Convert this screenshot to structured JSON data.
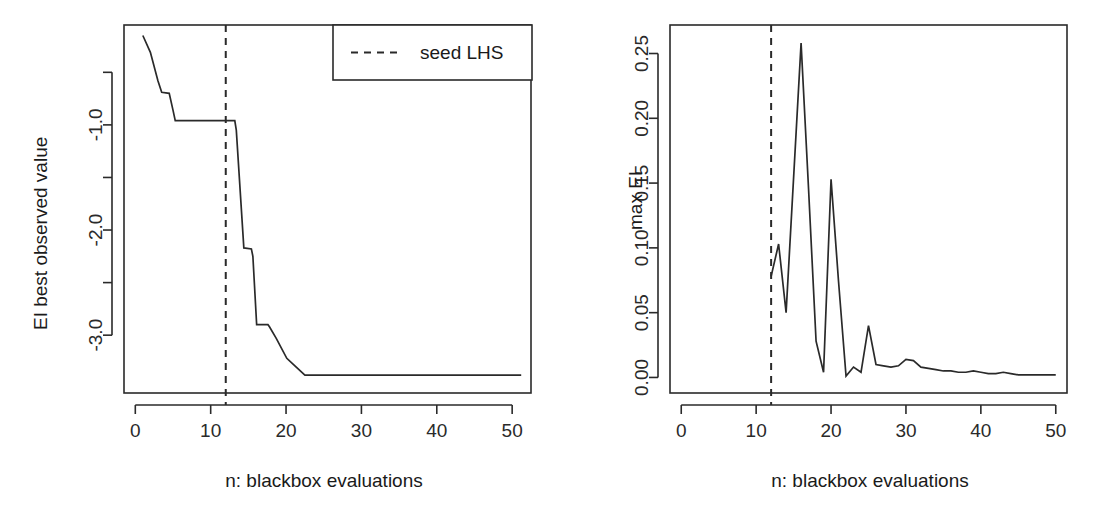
{
  "figure": {
    "background": "#ffffff",
    "ink_color": "#2a2a2a",
    "panel_count": 2
  },
  "chart_data": [
    {
      "type": "line",
      "panel": "left",
      "title": "",
      "xlabel": "n: blackbox evaluations",
      "ylabel": "EI best observed value",
      "xlim": [
        -1.5,
        52.5
      ],
      "ylim": [
        -3.55,
        -0.05
      ],
      "xticks": [
        0,
        10,
        20,
        30,
        40,
        50
      ],
      "xtick_labels": [
        "0",
        "10",
        "20",
        "30",
        "40",
        "50"
      ],
      "yticks": [
        -0.5,
        -1.0,
        -1.5,
        -2.0,
        -2.5,
        -3.0
      ],
      "ytick_labels": [
        "",
        "-1.0",
        "",
        "-2.0",
        "",
        "-3.0"
      ],
      "grid": false,
      "legend": {
        "position": "top-right",
        "entries": [
          {
            "label": "seed LHS",
            "style": "dashed",
            "color": "#2a2a2a"
          }
        ]
      },
      "annotations": [
        {
          "type": "vline",
          "label": "seed LHS",
          "x": 12,
          "style": "dashed"
        }
      ],
      "series": [
        {
          "name": "EI best observed value",
          "style": "solid",
          "color": "#2a2a2a",
          "x": [
            1,
            2,
            3,
            3.5,
            4.5,
            5,
            5.3,
            13.2,
            13.4,
            14.4,
            15.4,
            15.6,
            16.1,
            17.6,
            17.8,
            18.7,
            20.1,
            21.0,
            22.5,
            51.2
          ],
          "y": [
            -0.15,
            -0.31,
            -0.58,
            -0.69,
            -0.7,
            -0.86,
            -0.96,
            -0.96,
            -1.05,
            -2.17,
            -2.18,
            -2.25,
            -2.9,
            -2.9,
            -2.92,
            -3.03,
            -3.22,
            -3.28,
            -3.38,
            -3.38
          ]
        }
      ]
    },
    {
      "type": "line",
      "panel": "right",
      "title": "",
      "xlabel": "n: blackbox evaluations",
      "ylabel": "max EI",
      "xlim": [
        -1.5,
        51.5
      ],
      "ylim": [
        -0.012,
        0.272
      ],
      "xticks": [
        0,
        10,
        20,
        30,
        40,
        50
      ],
      "xtick_labels": [
        "0",
        "10",
        "20",
        "30",
        "40",
        "50"
      ],
      "yticks": [
        0.0,
        0.05,
        0.1,
        0.15,
        0.2,
        0.25
      ],
      "ytick_labels": [
        "0.00",
        "0.05",
        "0.10",
        "0.15",
        "0.20",
        "0.25"
      ],
      "grid": false,
      "legend": null,
      "annotations": [
        {
          "type": "vline",
          "label": "seed LHS",
          "x": 12,
          "style": "dashed"
        }
      ],
      "series": [
        {
          "name": "max EI",
          "style": "solid",
          "color": "#2a2a2a",
          "x": [
            12,
            13,
            14,
            16,
            17,
            18,
            19,
            20,
            21,
            22,
            23,
            24,
            25,
            26,
            27,
            28,
            29,
            30,
            31,
            32,
            33,
            34,
            35,
            36,
            37,
            38,
            39,
            40,
            41,
            42,
            43,
            44,
            45,
            46,
            47,
            48,
            49,
            50
          ],
          "y": [
            0.078,
            0.103,
            0.05,
            0.258,
            0.145,
            0.028,
            0.004,
            0.153,
            0.074,
            0.001,
            0.008,
            0.004,
            0.04,
            0.01,
            0.009,
            0.008,
            0.009,
            0.014,
            0.013,
            0.008,
            0.007,
            0.006,
            0.005,
            0.005,
            0.004,
            0.004,
            0.005,
            0.004,
            0.003,
            0.003,
            0.004,
            0.003,
            0.002,
            0.002,
            0.002,
            0.002,
            0.002,
            0.002
          ]
        }
      ]
    }
  ],
  "panels": {
    "left": {
      "name": "ei-best-observed-value-plot",
      "ylabel": "EI best observed value",
      "xlabel": "n: blackbox evaluations",
      "xtick_labels": [
        "0",
        "10",
        "20",
        "30",
        "40",
        "50"
      ],
      "ytick_labels": [
        "-1.0",
        "-2.0",
        "-3.0"
      ],
      "legend_label": "seed LHS"
    },
    "right": {
      "name": "max-ei-plot",
      "ylabel": "max EI",
      "xlabel": "n: blackbox evaluations",
      "xtick_labels": [
        "0",
        "10",
        "20",
        "30",
        "40",
        "50"
      ],
      "ytick_labels": [
        "0.00",
        "0.05",
        "0.10",
        "0.15",
        "0.20",
        "0.25"
      ]
    }
  }
}
